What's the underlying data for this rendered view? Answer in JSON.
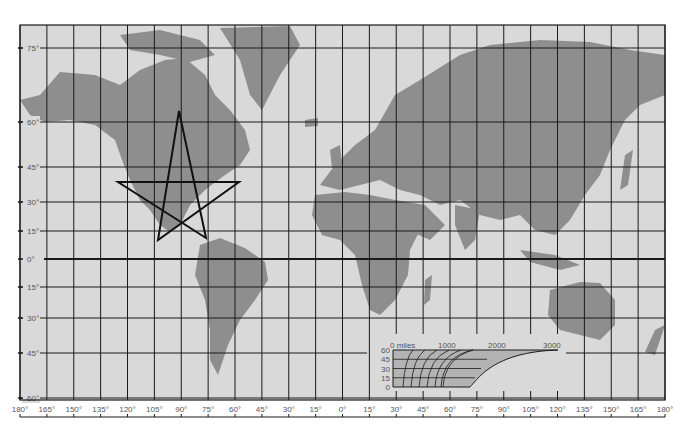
{
  "map": {
    "projection": "Mercator",
    "colors": {
      "paper": "#d9d9d9",
      "land": "#8e8e8e",
      "grid": "#1a1a1a",
      "star": "#111111",
      "scale_fill": "#b3b3b3",
      "label": "#555555"
    },
    "frame": {
      "left": 20,
      "right": 665,
      "top": 25,
      "bottom": 400
    },
    "latitudes": [
      {
        "label": "75°",
        "y": 48
      },
      {
        "label": "60°",
        "y": 122
      },
      {
        "label": "45°",
        "y": 167
      },
      {
        "label": "30°",
        "y": 202
      },
      {
        "label": "15°",
        "y": 231
      },
      {
        "label": "0°",
        "y": 259,
        "equator": true
      },
      {
        "label": "15°",
        "y": 287
      },
      {
        "label": "30°",
        "y": 318
      },
      {
        "label": "45°",
        "y": 353
      },
      {
        "label": "60°",
        "y": 398
      }
    ],
    "longitudes": [
      "180°",
      "165°",
      "150°",
      "135°",
      "120°",
      "105°",
      "90°",
      "75°",
      "60°",
      "45°",
      "30°",
      "15°",
      "0°",
      "15°",
      "30°",
      "45°",
      "60°",
      "75°",
      "90°",
      "105°",
      "120°",
      "135°",
      "150°",
      "165°",
      "180°"
    ],
    "star": {
      "points": [
        [
          179,
          111
        ],
        [
          206,
          238
        ],
        [
          118,
          182
        ],
        [
          239,
          182
        ],
        [
          158,
          240
        ]
      ]
    },
    "scale": {
      "title": "0 miles",
      "distance_labels": [
        "0 miles",
        "1000",
        "2000",
        "3000"
      ],
      "lat_labels": [
        "60",
        "45",
        "30",
        "15",
        "0"
      ],
      "box": {
        "x": 393,
        "y": 350,
        "w": 165,
        "h": 37
      }
    }
  }
}
